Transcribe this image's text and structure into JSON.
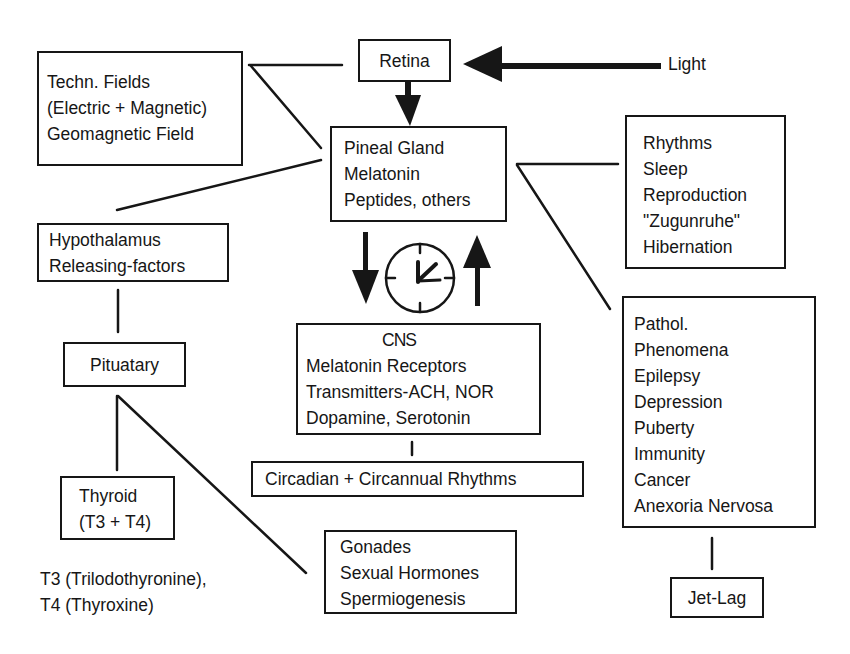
{
  "diagram": {
    "type": "flow-diagram",
    "nodes": {
      "light": {
        "label": "Light"
      },
      "retina": {
        "label": "Retina"
      },
      "techn_fields": {
        "lines": [
          "Techn. Fields",
          "(Electric + Magnetic)",
          "Geomagnetic Field"
        ]
      },
      "pineal": {
        "lines": [
          "Pineal Gland",
          "Melatonin",
          "Peptides, others"
        ]
      },
      "rhythms": {
        "lines": [
          "Rhythms",
          "Sleep",
          "Reproduction",
          "\"Zugunruhe\"",
          "Hibernation"
        ]
      },
      "hypothalamus": {
        "lines": [
          "Hypothalamus",
          "Releasing-factors"
        ]
      },
      "pituatary": {
        "label": "Pituatary"
      },
      "cns": {
        "lines": [
          "CNS",
          "Melatonin Receptors",
          "Transmitters-ACH, NOR",
          "Dopamine, Serotonin"
        ]
      },
      "circadian": {
        "label": "Circadian + Circannual Rhythms"
      },
      "pathol": {
        "lines": [
          "Pathol.",
          "Phenomena",
          "Epilepsy",
          "Depression",
          "Puberty",
          "Immunity",
          "Cancer",
          "Anexoria Nervosa"
        ]
      },
      "thyroid": {
        "lines": [
          "Thyroid",
          "(T3 + T4)"
        ]
      },
      "thyroid_note": {
        "lines": [
          "T3 (Trilodothyronine),",
          "T4 (Thyroxine)"
        ]
      },
      "gonades": {
        "lines": [
          "Gonades",
          "Sexual Hormones",
          "Spermiogenesis"
        ]
      },
      "jetlag": {
        "label": "Jet-Lag"
      }
    },
    "edges": [
      {
        "from": "light",
        "to": "retina",
        "style": "arrow"
      },
      {
        "from": "retina",
        "to": "pineal",
        "style": "arrow"
      },
      {
        "from": "techn_fields",
        "to": "retina",
        "style": "line"
      },
      {
        "from": "techn_fields",
        "to": "pineal",
        "style": "line"
      },
      {
        "from": "pineal",
        "to": "hypothalamus",
        "style": "line"
      },
      {
        "from": "pineal",
        "to": "rhythms",
        "style": "line"
      },
      {
        "from": "pineal",
        "to": "pathol",
        "style": "line"
      },
      {
        "from": "pineal",
        "to": "cns",
        "style": "arrow-down"
      },
      {
        "from": "cns",
        "to": "pineal",
        "style": "arrow-up"
      },
      {
        "from": "hypothalamus",
        "to": "pituatary",
        "style": "line"
      },
      {
        "from": "pituatary",
        "to": "thyroid",
        "style": "line"
      },
      {
        "from": "pituatary",
        "to": "gonades",
        "style": "line"
      },
      {
        "from": "cns",
        "to": "circadian",
        "style": "line"
      },
      {
        "from": "pathol",
        "to": "jetlag",
        "style": "line"
      }
    ],
    "icons": {
      "clock": "clock-icon"
    },
    "colors": {
      "ink": "#161616",
      "background": "#ffffff"
    }
  }
}
